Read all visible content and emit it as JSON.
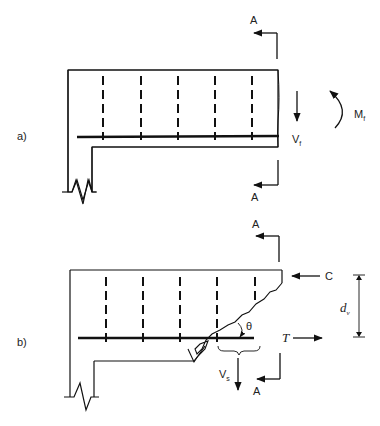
{
  "figure": {
    "panel_a": {
      "label": "a)",
      "section_top": "A",
      "section_bottom": "A",
      "shear_label": "V",
      "shear_sub": "f",
      "moment_label": "M",
      "moment_sub": "f",
      "stirrup_count": 5
    },
    "panel_b": {
      "label": "b)",
      "section_top": "A",
      "section_bottom": "A",
      "compression_label": "C",
      "tension_label": "T",
      "depth_label": "d",
      "depth_sub": "v",
      "angle_label": "θ",
      "stirrup_force_label": "V",
      "stirrup_force_sub": "s",
      "stirrup_count": 5
    }
  }
}
